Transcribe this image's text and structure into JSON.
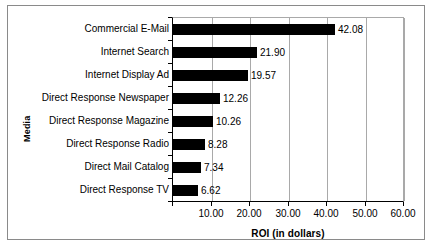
{
  "chart_data": {
    "type": "bar",
    "orientation": "horizontal",
    "title": "",
    "xlabel": "ROI (in dollars)",
    "ylabel": "Media",
    "xlim": [
      0,
      60
    ],
    "xticks": [
      "10.00",
      "20.00",
      "30.00",
      "40.00",
      "50.00",
      "60.00"
    ],
    "xtick_values": [
      10,
      20,
      30,
      40,
      50,
      60
    ],
    "grid": "vertical",
    "legend": "none",
    "categories": [
      "Commercial E-Mail",
      "Internet Search",
      "Internet Display Ad",
      "Direct Response Newspaper",
      "Direct Response Magazine",
      "Direct Response Radio",
      "Direct Mail Catalog",
      "Direct Response TV"
    ],
    "values": [
      42.08,
      21.9,
      19.57,
      12.26,
      10.26,
      8.28,
      7.34,
      6.62
    ],
    "value_labels": [
      "42.08",
      "21.90",
      "19.57",
      "12.26",
      "10.26",
      "8.28",
      "7.34",
      "6.62"
    ],
    "bar_color": "#000000"
  }
}
